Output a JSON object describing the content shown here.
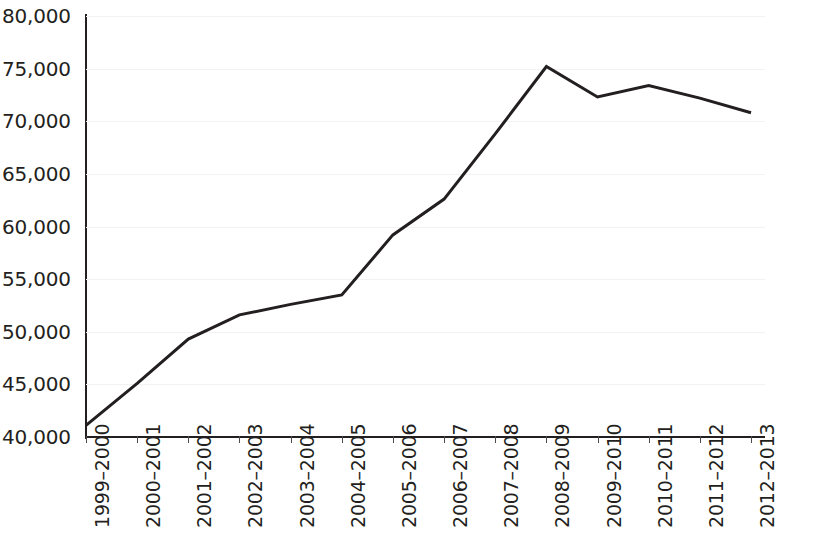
{
  "chart_data": {
    "type": "line",
    "title": "",
    "xlabel": "",
    "ylabel": "",
    "categories": [
      "1999–2000",
      "2000–2001",
      "2001–2002",
      "2002–2003",
      "2003–2004",
      "2004–2005",
      "2005–2006",
      "2006–2007",
      "2007–2008",
      "2008–2009",
      "2009–2010",
      "2010–2011",
      "2011–2012",
      "2012–2013"
    ],
    "values": [
      41100,
      45100,
      49300,
      51600,
      52600,
      53500,
      59200,
      62600,
      68800,
      75200,
      72300,
      73400,
      72200,
      70800
    ],
    "series": [
      {
        "name": "",
        "values": [
          41100,
          45100,
          49300,
          51600,
          52600,
          53500,
          59200,
          62600,
          68800,
          75200,
          72300,
          73400,
          72200,
          70800
        ]
      }
    ],
    "ylim": [
      40000,
      80000
    ],
    "ytick_values": [
      40000,
      45000,
      50000,
      55000,
      60000,
      65000,
      70000,
      75000,
      80000
    ],
    "ytick_labels": [
      "40,000",
      "45,000",
      "50,000",
      "55,000",
      "60,000",
      "65,000",
      "70,000",
      "75,000",
      "80,000"
    ],
    "grid": true,
    "legend": "none",
    "line_color": "#231f20",
    "line_width": 3,
    "markers": false,
    "xtick_label_rotation": 90
  }
}
